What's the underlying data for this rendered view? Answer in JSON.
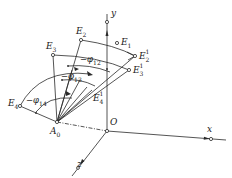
{
  "diagram": {
    "title": "",
    "axes": {
      "x_label": "x",
      "y_label": "y",
      "z_label": "z",
      "origin_label": "O"
    },
    "pivot": {
      "name": "A",
      "sub": "0"
    },
    "points": [
      {
        "id": "E1",
        "name": "E",
        "sub": "1",
        "sup": ""
      },
      {
        "id": "E2",
        "name": "E",
        "sub": "2",
        "sup": ""
      },
      {
        "id": "E3",
        "name": "E",
        "sub": "3",
        "sup": ""
      },
      {
        "id": "E4",
        "name": "E",
        "sub": "4",
        "sup": ""
      },
      {
        "id": "E2_1",
        "name": "E",
        "sub": "2",
        "sup": "1"
      },
      {
        "id": "E3_1",
        "name": "E",
        "sub": "3",
        "sup": "1"
      },
      {
        "id": "E4_1",
        "name": "E",
        "sub": "4",
        "sup": "1"
      }
    ],
    "angles": [
      {
        "id": "phi12",
        "prefix": "−φ",
        "sub": "12"
      },
      {
        "id": "phi13",
        "prefix": "−φ",
        "sub": "13"
      },
      {
        "id": "phi14",
        "prefix": "−φ",
        "sub": "14"
      }
    ],
    "colors": {
      "line": "#2a2a2a",
      "background": "#ffffff"
    }
  }
}
